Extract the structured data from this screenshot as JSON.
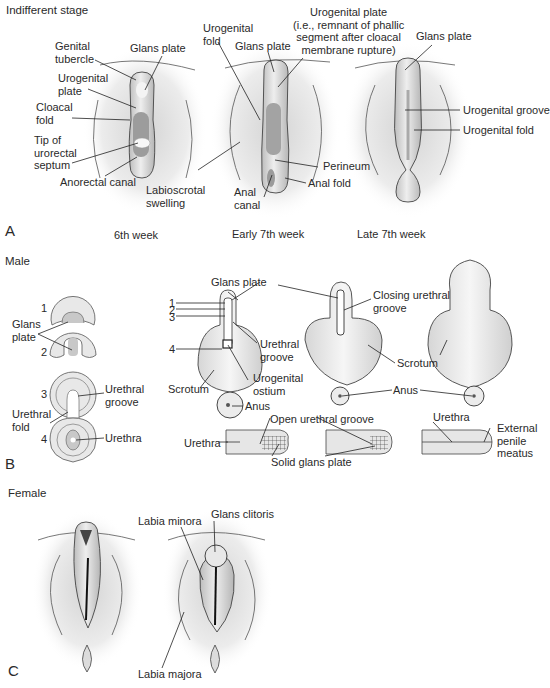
{
  "figure": {
    "panels": {
      "A": {
        "letter": "A",
        "section_title": "Indifferent stage",
        "stages": [
          "6th week",
          "Early 7th week",
          "Late 7th week"
        ],
        "labels": {
          "genital_tubercle": "Genital\ntubercle",
          "glans_plate_1": "Glans plate",
          "urogenital_plate_1": "Urogenital\nplate",
          "cloacal_fold": "Cloacal\nfold",
          "tip_urorectal_septum": "Tip of\nurorectal\nseptum",
          "anorectal_canal": "Anorectal canal",
          "labioscrotal_swelling": "Labioscrotal\nswelling",
          "urogenital_fold_2": "Urogenital\nfold",
          "glans_plate_2": "Glans plate",
          "urogenital_plate_2": "Urogenital plate\n(i.e., remnant of phallic\nsegment after cloacal\nmembrane rupture)",
          "perineum": "Perineum",
          "anal_fold": "Anal fold",
          "anal_canal": "Anal\ncanal",
          "glans_plate_3": "Glans plate",
          "urogenital_groove": "Urogenital groove",
          "urogenital_fold_3": "Urogenital fold"
        }
      },
      "B": {
        "letter": "B",
        "section_title": "Male",
        "cross_section_numbers": [
          "1",
          "2",
          "3",
          "4"
        ],
        "labels": {
          "glans_plate_cs": "Glans\nplate",
          "urethral_groove_cs": "Urethral\ngroove",
          "urethral_fold_cs": "Urethral\nfold",
          "urethra_cs": "Urethra",
          "glans_plate_m": "Glans plate",
          "urethral_groove_m": "Urethral\ngroove",
          "urogenital_ostium": "Urogenital\nostium",
          "scrotum_1": "Scrotum",
          "anus_1": "Anus",
          "closing_urethral_groove": "Closing urethral\ngroove",
          "scrotum_2": "Scrotum",
          "anus_2": "Anus",
          "open_urethral_groove": "Open urethral groove",
          "urethra_long_1": "Urethra",
          "solid_glans_plate": "Solid glans plate",
          "urethra_long_3": "Urethra",
          "external_penile_meatus": "External\npenile\nmeatus"
        }
      },
      "C": {
        "letter": "C",
        "section_title": "Female",
        "labels": {
          "labia_minora": "Labia minora",
          "glans_clitoris": "Glans clitoris",
          "labia_majora": "Labia majora"
        }
      }
    },
    "colors": {
      "background": "#ffffff",
      "tissue_light": "#e6e6e6",
      "tissue_mid": "#c8c8c8",
      "tissue_dark": "#9a9a9a",
      "line": "#222222",
      "text": "#2a2a2a"
    }
  }
}
